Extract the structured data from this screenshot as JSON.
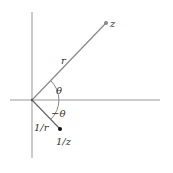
{
  "diagram": {
    "labels": {
      "z": "z",
      "r": "r",
      "theta": "θ",
      "neg_theta": "−θ",
      "inv_r": "1/r",
      "inv_z": "1/z"
    },
    "points": {
      "origin": [
        32,
        100
      ],
      "z": [
        106,
        23
      ],
      "inv_z": [
        60,
        129
      ]
    },
    "colors": {
      "axis": "#888888",
      "line": "#777777",
      "z_point": "#888888",
      "inv_z_point": "#111111"
    }
  }
}
